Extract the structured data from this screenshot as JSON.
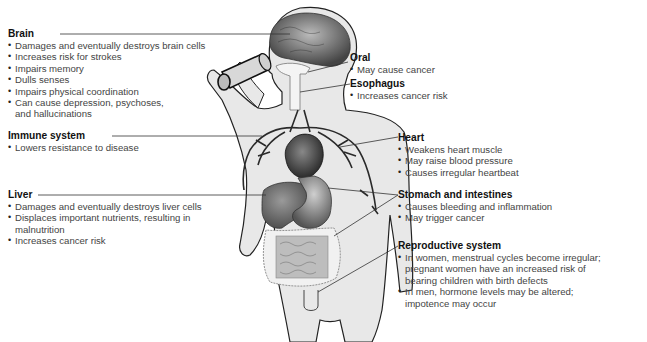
{
  "labels": {
    "brain": {
      "title": "Brain",
      "items": [
        "Damages and eventually destroys brain cells",
        "Increases risk for strokes",
        "Impairs memory",
        "Dulls senses",
        "Impairs physical coordination",
        "Can cause depression, psychoses, and hallucinations"
      ]
    },
    "immune": {
      "title": "Immune system",
      "items": [
        "Lowers resistance to disease"
      ]
    },
    "liver": {
      "title": "Liver",
      "items": [
        "Damages and eventually destroys liver cells",
        "Displaces important nutrients, resulting in malnutrition",
        "Increases cancer risk"
      ]
    },
    "oral": {
      "title": "Oral",
      "items": [
        "May cause cancer"
      ]
    },
    "esophagus": {
      "title": "Esophagus",
      "items": [
        "Increases cancer risk"
      ]
    },
    "heart": {
      "title": "Heart",
      "items": [
        "Weakens heart muscle",
        "May raise blood pressure",
        "Causes irregular heartbeat"
      ]
    },
    "stomach": {
      "title": "Stomach and intestines",
      "items": [
        "Causes bleeding and inflammation",
        "May trigger cancer"
      ]
    },
    "reproductive": {
      "title": "Reproductive system",
      "items": [
        "In women, menstrual cycles become irregular; pregnant women have an increased risk of bearing children with birth defects",
        "In men, hormone levels may be altered; impotence may occur"
      ]
    }
  },
  "colors": {
    "body_fill": "#e6e6e6",
    "outline": "#222222",
    "organ_dark": "#555555",
    "organ_mid": "#8a8a8a",
    "leader_line": "#333333"
  }
}
